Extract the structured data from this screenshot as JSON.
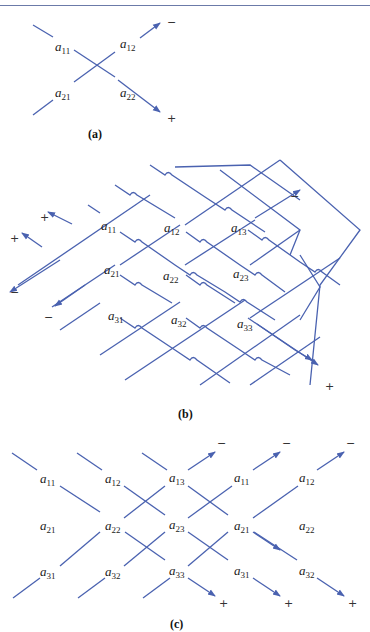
{
  "figure": {
    "line_color": "#4a62b0",
    "panels": [
      {
        "caption": "(a)",
        "description": "2x2 determinant diagonal rule",
        "entries": [
          {
            "base": "a",
            "sub": "11"
          },
          {
            "base": "a",
            "sub": "12"
          },
          {
            "base": "a",
            "sub": "21"
          },
          {
            "base": "a",
            "sub": "22"
          }
        ],
        "signs": {
          "upper": "−",
          "lower": "+"
        }
      },
      {
        "caption": "(b)",
        "description": "3x3 determinant with wrap-around diagonals",
        "entries": [
          {
            "base": "a",
            "sub": "11"
          },
          {
            "base": "a",
            "sub": "12"
          },
          {
            "base": "a",
            "sub": "13"
          },
          {
            "base": "a",
            "sub": "21"
          },
          {
            "base": "a",
            "sub": "22"
          },
          {
            "base": "a",
            "sub": "23"
          },
          {
            "base": "a",
            "sub": "31"
          },
          {
            "base": "a",
            "sub": "32"
          },
          {
            "base": "a",
            "sub": "33"
          }
        ],
        "signs": {
          "left_top_1": "+",
          "left_top_2": "+",
          "left_bottom_1": "−",
          "left_bottom_2": "−",
          "right_top": "−",
          "right_bottom": "+"
        }
      },
      {
        "caption": "(c)",
        "description": "Sarrus rule with repeated columns",
        "entries": [
          {
            "base": "a",
            "sub": "11"
          },
          {
            "base": "a",
            "sub": "12"
          },
          {
            "base": "a",
            "sub": "13"
          },
          {
            "base": "a",
            "sub": "11"
          },
          {
            "base": "a",
            "sub": "12"
          },
          {
            "base": "a",
            "sub": "21"
          },
          {
            "base": "a",
            "sub": "22"
          },
          {
            "base": "a",
            "sub": "23"
          },
          {
            "base": "a",
            "sub": "21"
          },
          {
            "base": "a",
            "sub": "22"
          },
          {
            "base": "a",
            "sub": "31"
          },
          {
            "base": "a",
            "sub": "32"
          },
          {
            "base": "a",
            "sub": "33"
          },
          {
            "base": "a",
            "sub": "31"
          },
          {
            "base": "a",
            "sub": "32"
          }
        ],
        "signs": {
          "top": [
            "−",
            "−",
            "−"
          ],
          "bottom": [
            "+",
            "+",
            "+"
          ]
        }
      }
    ]
  }
}
